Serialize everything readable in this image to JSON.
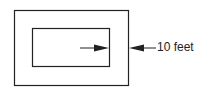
{
  "diagram": {
    "dimension_label": "10 feet",
    "stroke_color": "#222222",
    "background": "#ffffff"
  }
}
